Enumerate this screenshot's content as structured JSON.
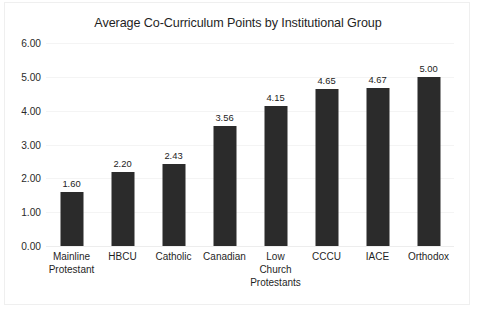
{
  "chart_data": {
    "type": "bar",
    "title": "Average Co-Curriculum Points by Institutional Group",
    "xlabel": "",
    "ylabel": "",
    "categories": [
      "Mainline Protestant",
      "HBCU",
      "Catholic",
      "Canadian",
      "Low Church Protestants",
      "CCCU",
      "IACE",
      "Orthodox"
    ],
    "category_lines": [
      [
        "Mainline",
        "Protestant"
      ],
      [
        "HBCU"
      ],
      [
        "Catholic"
      ],
      [
        "Canadian"
      ],
      [
        "Low Church",
        "Protestants"
      ],
      [
        "CCCU"
      ],
      [
        "IACE"
      ],
      [
        "Orthodox"
      ]
    ],
    "values": [
      1.6,
      2.2,
      2.43,
      3.56,
      4.15,
      4.65,
      4.67,
      5.0
    ],
    "value_labels": [
      "1.60",
      "2.20",
      "2.43",
      "3.56",
      "4.15",
      "4.65",
      "4.67",
      "5.00"
    ],
    "ylim": [
      0,
      6
    ],
    "ytick_values": [
      0,
      1,
      2,
      3,
      4,
      5,
      6
    ],
    "ytick_labels": [
      "0.00",
      "1.00",
      "2.00",
      "3.00",
      "4.00",
      "5.00",
      "6.00"
    ],
    "grid": true,
    "legend": false,
    "bar_color": "#2b2b2b",
    "background_color": "#ffffff",
    "border_color": "#efefef"
  }
}
